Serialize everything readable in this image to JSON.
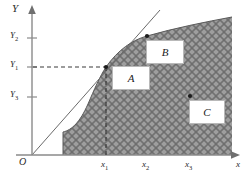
{
  "figure": {
    "type": "math-diagram",
    "background_color": "#ffffff",
    "region_fill_color": "#9a9a9a",
    "hatch_color": "#6d6d6d",
    "line_color": "#555555",
    "axes": {
      "y_axis_label": "Y",
      "x_axis_label": "x",
      "origin_label": "O",
      "y_ticks": [
        {
          "label": "Y",
          "sub": "2",
          "y_px": 38
        },
        {
          "label": "Y",
          "sub": "1",
          "y_px": 67
        },
        {
          "label": "Y",
          "sub": "3",
          "y_px": 97
        }
      ],
      "x_ticks": [
        {
          "label": "x",
          "sub": "1",
          "x_px": 106
        },
        {
          "label": "x",
          "sub": "2",
          "x_px": 147
        },
        {
          "label": "x",
          "sub": "3",
          "x_px": 190
        }
      ]
    },
    "points": [
      {
        "name": "A",
        "label": "A",
        "x_px": 106,
        "y_px": 67,
        "on_curve": true,
        "box_left": 112,
        "box_top": 66,
        "box_w": 36,
        "box_h": 22
      },
      {
        "name": "B",
        "label": "B",
        "x_px": 147,
        "y_px": 36,
        "on_curve": true,
        "box_left": 146,
        "box_top": 40,
        "box_w": 36,
        "box_h": 22
      },
      {
        "name": "C",
        "label": "C",
        "x_px": 190,
        "y_px": 96,
        "on_curve": false,
        "box_left": 189,
        "box_top": 100,
        "box_w": 34,
        "box_h": 22
      }
    ],
    "guides": {
      "horizontal_dashed_from": "Y1",
      "horizontal_dashed_to": "A",
      "vertical_dashed_from": "A",
      "vertical_dashed_to": "x1",
      "tangent_line": "ray from origin O tangent to curve at A"
    }
  }
}
